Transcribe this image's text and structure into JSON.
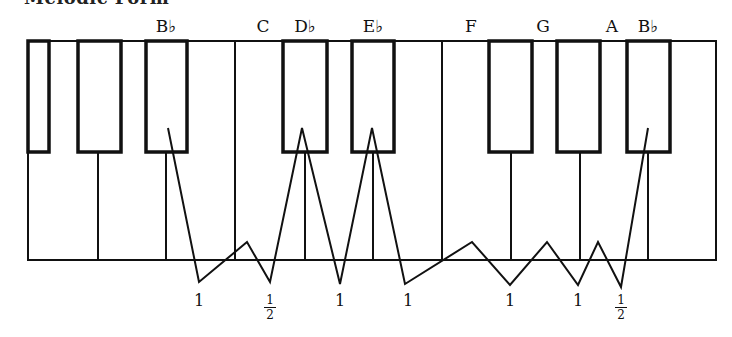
{
  "title": "Melodic Form",
  "keyboard": {
    "frame": {
      "x": 28,
      "y": 41,
      "width": 688,
      "height": 219
    },
    "white_key_dividers_x": [
      98,
      166,
      235,
      305,
      373,
      442,
      511,
      580,
      648
    ],
    "black_keys": [
      {
        "x": 28,
        "width": 21
      },
      {
        "x": 78,
        "width": 43
      },
      {
        "x": 146,
        "width": 41
      },
      {
        "x": 283,
        "width": 44
      },
      {
        "x": 352,
        "width": 42
      },
      {
        "x": 489,
        "width": 43
      },
      {
        "x": 557,
        "width": 43
      },
      {
        "x": 627,
        "width": 43
      }
    ],
    "black_key_bottom_y": 152,
    "stroke_color": "#111111"
  },
  "note_labels": [
    {
      "text": "B♭",
      "x": 166
    },
    {
      "text": "C",
      "x": 263
    },
    {
      "text": "D♭",
      "x": 305
    },
    {
      "text": "E♭",
      "x": 373
    },
    {
      "text": "F",
      "x": 471
    },
    {
      "text": "G",
      "x": 543
    },
    {
      "text": "A",
      "x": 612
    },
    {
      "text": "B♭",
      "x": 648
    }
  ],
  "zigzag_points": "168,128 199,282 247,242 270,282 302,128 340,284 372,128 405,284 472,242 510,285 547,242 578,285 598,242 621,287 648,128",
  "intervals": [
    {
      "value": "1",
      "x": 199,
      "type": "whole"
    },
    {
      "value": "1/2",
      "num": "1",
      "den": "2",
      "x": 270,
      "type": "half"
    },
    {
      "value": "1",
      "x": 340,
      "type": "whole"
    },
    {
      "value": "1",
      "x": 408,
      "type": "whole"
    },
    {
      "value": "1",
      "x": 510,
      "type": "whole"
    },
    {
      "value": "1",
      "x": 578,
      "type": "whole"
    },
    {
      "value": "1/2",
      "num": "1",
      "den": "2",
      "x": 621,
      "type": "half"
    }
  ]
}
